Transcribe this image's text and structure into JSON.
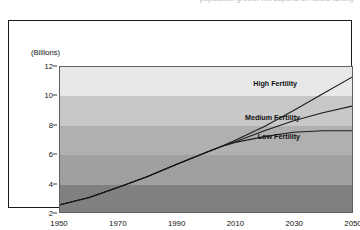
{
  "caption_sliver": "population growth will depend on future fertility",
  "chart_data": {
    "type": "line",
    "title": "",
    "subtitle": "",
    "xlabel": "",
    "ylabel": "(Billions)",
    "xlim": [
      1950,
      2050
    ],
    "ylim": [
      2,
      12
    ],
    "xticks": [
      1950,
      1970,
      1990,
      2010,
      2030,
      2050
    ],
    "yticks": [
      2,
      4,
      6,
      8,
      10,
      12
    ],
    "grid": false,
    "legend_position": "inline-annotations",
    "band_labels": [
      "2-4",
      "4-6",
      "6-8",
      "8-10",
      "10-12"
    ],
    "band_colors": [
      "#808080",
      "#a0a0a0",
      "#b0b0b0",
      "#c8c8c8",
      "#e8e8e8"
    ],
    "line_color": "#1b1b1b",
    "series": [
      {
        "name": "High Fertility",
        "label": "High Fertility",
        "label_x": 2031,
        "label_y": 10.85,
        "x": [
          1950,
          1960,
          1970,
          1980,
          1990,
          2000,
          2005,
          2010,
          2020,
          2030,
          2040,
          2050
        ],
        "values": [
          2.5,
          3.0,
          3.7,
          4.45,
          5.3,
          6.1,
          6.5,
          6.95,
          7.9,
          9.0,
          10.15,
          11.3
        ]
      },
      {
        "name": "Medium Fertility",
        "label": "Medium Fertility",
        "label_x": 2032,
        "label_y": 8.55,
        "x": [
          1950,
          1960,
          1970,
          1980,
          1990,
          2000,
          2005,
          2010,
          2020,
          2030,
          2040,
          2050
        ],
        "values": [
          2.5,
          3.0,
          3.7,
          4.45,
          5.3,
          6.1,
          6.5,
          6.85,
          7.6,
          8.3,
          8.85,
          9.3
        ]
      },
      {
        "name": "Low Fertility",
        "label": "Low Fertility",
        "label_x": 2032,
        "label_y": 7.25,
        "x": [
          1950,
          1960,
          1970,
          1980,
          1990,
          2000,
          2005,
          2010,
          2020,
          2030,
          2040,
          2050
        ],
        "values": [
          2.5,
          3.0,
          3.7,
          4.45,
          5.3,
          6.1,
          6.5,
          6.8,
          7.2,
          7.5,
          7.6,
          7.6
        ]
      }
    ]
  }
}
